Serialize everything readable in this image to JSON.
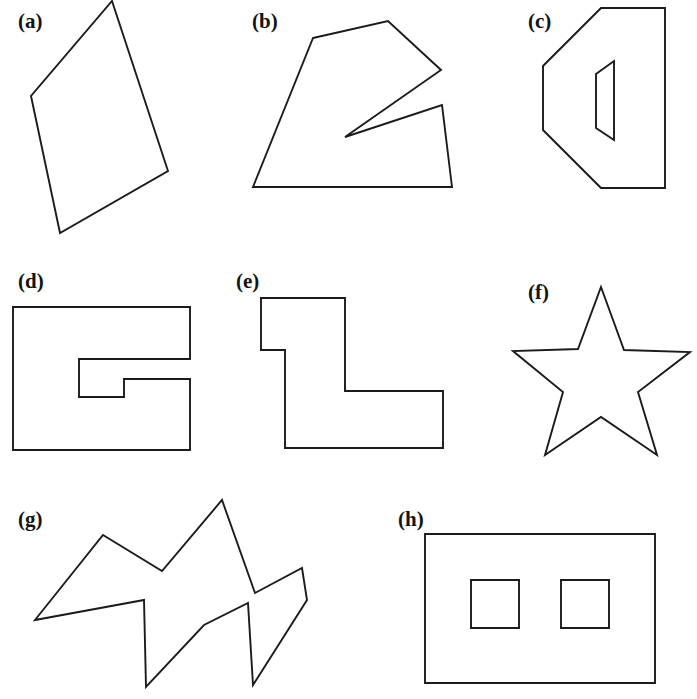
{
  "figure": {
    "background_color": "#ffffff",
    "outline_color": "#1b1b1b",
    "stipple_color": "#1b1b1b",
    "label_color": "#131313",
    "width": 697,
    "height": 699
  },
  "panels": [
    {
      "key": "a",
      "label": "(a)",
      "label_x": 18,
      "label_y": 28,
      "description": "convex quadrilateral, tilted",
      "fill": "stipple",
      "outline": [
        [
          112,
          1
        ],
        [
          168,
          171
        ],
        [
          60,
          233
        ],
        [
          31,
          96
        ]
      ],
      "holes": [],
      "stipple": {
        "count": 430,
        "min_r": 0.7,
        "max_r": 2.0,
        "seed": 11
      }
    },
    {
      "key": "b",
      "label": "(b)",
      "label_x": 252,
      "label_y": 28,
      "description": "polygon with deep V notch on the right side",
      "fill": "stipple",
      "outline": [
        [
          313,
          38
        ],
        [
          388,
          21
        ],
        [
          441,
          70
        ],
        [
          345,
          137
        ],
        [
          442,
          105
        ],
        [
          452,
          187
        ],
        [
          253,
          187
        ]
      ],
      "holes": [],
      "stipple": {
        "count": 300,
        "min_r": 0.7,
        "max_r": 2.2,
        "seed": 23
      }
    },
    {
      "key": "c",
      "label": "(c)",
      "label_x": 528,
      "label_y": 28,
      "description": "hexagon with a quadrilateral hole",
      "fill": "stipple",
      "outline": [
        [
          601,
          8
        ],
        [
          665,
          8
        ],
        [
          665,
          188
        ],
        [
          601,
          188
        ],
        [
          543,
          130
        ],
        [
          543,
          66
        ]
      ],
      "holes": [
        [
          [
            614,
            61
          ],
          [
            614,
            140
          ],
          [
            596,
            128
          ],
          [
            596,
            74
          ]
        ]
      ],
      "stipple": {
        "count": 300,
        "min_r": 0.7,
        "max_r": 2.0,
        "seed": 37
      }
    },
    {
      "key": "d",
      "label": "(d)",
      "label_x": 18,
      "label_y": 288,
      "description": "rectangle with stepped notch cut from the right edge",
      "fill": "stipple",
      "outline": [
        [
          13,
          307
        ],
        [
          190,
          307
        ],
        [
          190,
          359
        ],
        [
          79,
          359
        ],
        [
          79,
          397
        ],
        [
          124,
          397
        ],
        [
          124,
          379
        ],
        [
          190,
          379
        ],
        [
          190,
          450
        ],
        [
          13,
          450
        ]
      ],
      "holes": [],
      "stipple": {
        "count": 400,
        "min_r": 0.7,
        "max_r": 2.1,
        "seed": 53
      }
    },
    {
      "key": "e",
      "label": "(e)",
      "label_x": 236,
      "label_y": 288,
      "description": "L-shaped polygon with a step on the left",
      "fill": "stipple",
      "outline": [
        [
          261,
          298
        ],
        [
          345,
          298
        ],
        [
          345,
          391
        ],
        [
          443,
          391
        ],
        [
          443,
          448
        ],
        [
          285,
          448
        ],
        [
          285,
          350
        ],
        [
          261,
          350
        ]
      ],
      "holes": [],
      "stipple": {
        "count": 300,
        "min_r": 0.7,
        "max_r": 2.2,
        "seed": 71
      }
    },
    {
      "key": "f",
      "label": "(f)",
      "label_x": 528,
      "label_y": 299,
      "description": "five pointed star",
      "fill": "stipple",
      "outline": [
        [
          601,
          287
        ],
        [
          624,
          350
        ],
        [
          690,
          352
        ],
        [
          638,
          392
        ],
        [
          657,
          455
        ],
        [
          601,
          417
        ],
        [
          545,
          455
        ],
        [
          563,
          392
        ],
        [
          513,
          351
        ],
        [
          578,
          349
        ]
      ],
      "holes": [],
      "stipple": {
        "count": 300,
        "min_r": 0.7,
        "max_r": 2.0,
        "seed": 97
      }
    },
    {
      "key": "g",
      "label": "(g)",
      "label_x": 18,
      "label_y": 526,
      "description": "four pointed zigzag crown polygon",
      "fill": "stipple",
      "outline": [
        [
          103,
          535
        ],
        [
          162,
          571
        ],
        [
          222,
          500
        ],
        [
          255,
          593
        ],
        [
          302,
          568
        ],
        [
          307,
          600
        ],
        [
          253,
          685
        ],
        [
          248,
          603
        ],
        [
          204,
          625
        ],
        [
          146,
          687
        ],
        [
          144,
          600
        ],
        [
          35,
          620
        ]
      ],
      "holes": [],
      "stipple": {
        "count": 330,
        "min_r": 0.7,
        "max_r": 2.0,
        "seed": 131
      }
    },
    {
      "key": "h",
      "label": "(h)",
      "label_x": 398,
      "label_y": 526,
      "description": "rectangle with two square holes",
      "fill": "stipple",
      "outline": [
        [
          425,
          534
        ],
        [
          655,
          534
        ],
        [
          655,
          683
        ],
        [
          425,
          683
        ]
      ],
      "holes": [
        [
          [
            471,
            580
          ],
          [
            519,
            580
          ],
          [
            519,
            628
          ],
          [
            471,
            628
          ]
        ],
        [
          [
            561,
            580
          ],
          [
            609,
            580
          ],
          [
            609,
            628
          ],
          [
            561,
            628
          ]
        ]
      ],
      "stipple": {
        "count": 520,
        "min_r": 0.7,
        "max_r": 2.1,
        "seed": 163
      }
    }
  ]
}
